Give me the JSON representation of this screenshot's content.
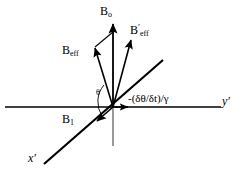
{
  "figure": {
    "background_color": "#ffffff",
    "stroke_color": "#000000",
    "labels": {
      "b0": "B",
      "b0_sub": "o",
      "beff_prime": "B",
      "beff_prime_sup": "′",
      "beff_prime_sub": "eff",
      "beff": "B",
      "beff_sub": "eff",
      "b1": "B",
      "b1_sub": "1",
      "theta": "θ",
      "rate": "-(δθ/δt)/γ",
      "y_axis": "y′",
      "x_axis": "x′"
    },
    "vectors": [
      {
        "name": "B-o",
        "label": "Bₒ",
        "description": "vertical field along z, pointing up from origin"
      },
      {
        "name": "B-eff",
        "label": "B_eff",
        "description": "effective field tilted left of vertical"
      },
      {
        "name": "B-eff-prime",
        "label": "B′_eff",
        "description": "effective field tilted right of vertical"
      },
      {
        "name": "B-1",
        "label": "B₁",
        "description": "RF field along negative x′ direction"
      },
      {
        "name": "rate-vector",
        "label": "-(δθ/δt)/γ",
        "description": "short arrow along positive y′ axis"
      }
    ],
    "axes": [
      {
        "name": "y-prime-axis",
        "label": "y′",
        "orientation": "horizontal"
      },
      {
        "name": "x-prime-axis",
        "label": "x′",
        "orientation": "diagonal-lower-left-to-upper-right"
      },
      {
        "name": "z-axis",
        "label": "",
        "orientation": "vertical"
      }
    ]
  }
}
